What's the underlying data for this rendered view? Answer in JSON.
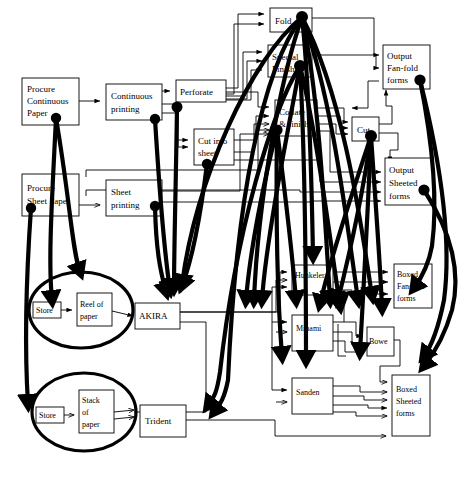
{
  "diagram": {
    "type": "process-flow-network",
    "width": 476,
    "height": 480,
    "background_color": "#ffffff",
    "line_color": "#000000",
    "nodes": [
      {
        "id": "procure_continuous",
        "label": "Procure\nContinuous\nPaper",
        "lines": [
          "Procure",
          "Continuous",
          "Paper"
        ],
        "shape": "rect",
        "x": 22,
        "y": 78,
        "w": 57,
        "h": 47
      },
      {
        "id": "procure_sheet",
        "label": "Procure\nSheet Paper",
        "lines": [
          "Procure",
          "Sheet Paper"
        ],
        "shape": "rect",
        "x": 22,
        "y": 174,
        "w": 57,
        "h": 42
      },
      {
        "id": "continuous_printing",
        "label": "Continuous\nprinting",
        "lines": [
          "Continuous",
          "printing"
        ],
        "shape": "rect",
        "x": 106,
        "y": 84,
        "w": 56,
        "h": 36
      },
      {
        "id": "sheet_printing",
        "label": "Sheet\nprinting",
        "lines": [
          "Sheet",
          "printing"
        ],
        "shape": "rect",
        "x": 106,
        "y": 180,
        "w": 56,
        "h": 36
      },
      {
        "id": "perforate",
        "label": "Perforate",
        "lines": [
          "Perforate"
        ],
        "shape": "rect",
        "x": 176,
        "y": 80,
        "w": 50,
        "h": 22
      },
      {
        "id": "cut_into_sheet",
        "label": "Cut into\nsheet",
        "lines": [
          "Cut into",
          "sheet"
        ],
        "shape": "rect",
        "x": 194,
        "y": 129,
        "w": 40,
        "h": 36
      },
      {
        "id": "fold",
        "label": "Fold",
        "lines": [
          "Fold"
        ],
        "shape": "rect",
        "x": 270,
        "y": 8,
        "w": 42,
        "h": 24
      },
      {
        "id": "special_finish",
        "label": "Special\nFinish",
        "lines": [
          "Special",
          "Finish"
        ],
        "shape": "rect",
        "x": 268,
        "y": 45,
        "w": 44,
        "h": 32
      },
      {
        "id": "collate_finish",
        "label": "Collate\n& finish",
        "lines": [
          "Collate",
          "& finish"
        ],
        "shape": "rect",
        "x": 275,
        "y": 100,
        "w": 42,
        "h": 36
      },
      {
        "id": "cut",
        "label": "Cut",
        "lines": [
          "Cut"
        ],
        "shape": "rect",
        "x": 352,
        "y": 117,
        "w": 27,
        "h": 24
      },
      {
        "id": "output_fanfold",
        "label": "Output\nFan-fold\nforms",
        "lines": [
          "Output",
          "Fan-fold",
          "forms"
        ],
        "shape": "rect",
        "x": 383,
        "y": 45,
        "w": 47,
        "h": 44
      },
      {
        "id": "output_sheeted",
        "label": "Output\nSheeted\nforms",
        "lines": [
          "Output",
          "Sheeted",
          "forms"
        ],
        "shape": "rect",
        "x": 385,
        "y": 158,
        "w": 48,
        "h": 47
      },
      {
        "id": "store_reel",
        "label": "Store",
        "lines": [
          "Store"
        ],
        "shape": "rect",
        "x": 33,
        "y": 302,
        "w": 28,
        "h": 16
      },
      {
        "id": "reel_of_paper",
        "label": "Reel of\npaper",
        "lines": [
          "Reel of",
          "paper"
        ],
        "shape": "rect",
        "x": 77,
        "y": 293,
        "w": 35,
        "h": 33
      },
      {
        "id": "ellipse_reel",
        "label": "",
        "lines": [],
        "shape": "ellipse",
        "cx": 81,
        "cy": 310,
        "rx": 52,
        "ry": 38
      },
      {
        "id": "akira",
        "label": "AKIRA",
        "lines": [
          "AKIRA"
        ],
        "shape": "rect",
        "x": 135,
        "y": 303,
        "w": 45,
        "h": 26
      },
      {
        "id": "store_stack",
        "label": "Store",
        "lines": [
          "Store"
        ],
        "shape": "rect",
        "x": 36,
        "y": 407,
        "w": 28,
        "h": 16
      },
      {
        "id": "stack_of_paper",
        "label": "Stack\nof\npaper",
        "lines": [
          "Stack",
          "of",
          "paper"
        ],
        "shape": "rect",
        "x": 79,
        "y": 390,
        "w": 35,
        "h": 43
      },
      {
        "id": "ellipse_stack",
        "label": "",
        "lines": [],
        "shape": "ellipse",
        "cx": 84,
        "cy": 412,
        "rx": 52,
        "ry": 39
      },
      {
        "id": "trident",
        "label": "Trident",
        "lines": [
          "Trident"
        ],
        "shape": "rect",
        "x": 140,
        "y": 405,
        "w": 46,
        "h": 32
      },
      {
        "id": "hunkeler",
        "label": "Hunkeler",
        "lines": [
          "Hunkeler"
        ],
        "shape": "rect",
        "x": 292,
        "y": 265,
        "w": 41,
        "h": 30
      },
      {
        "id": "minami",
        "label": "Minami",
        "lines": [
          "Minami"
        ],
        "shape": "rect",
        "x": 292,
        "y": 315,
        "w": 41,
        "h": 36
      },
      {
        "id": "sanden",
        "label": "Sanden",
        "lines": [
          "Sanden"
        ],
        "shape": "rect",
        "x": 292,
        "y": 378,
        "w": 41,
        "h": 36
      },
      {
        "id": "bowe",
        "label": "Bowe",
        "lines": [
          "Bowe"
        ],
        "shape": "rect",
        "x": 367,
        "y": 327,
        "w": 27,
        "h": 29
      },
      {
        "id": "boxed_fanfold",
        "label": "Boxed\nFan-fold\nforms",
        "lines": [
          "Boxed",
          "Fan-fold",
          "forms"
        ],
        "shape": "rect",
        "x": 394,
        "y": 264,
        "w": 38,
        "h": 44
      },
      {
        "id": "boxed_sheeted",
        "label": "Boxed\nSheeted\nforms",
        "lines": [
          "Boxed",
          "Sheeted",
          "forms"
        ],
        "shape": "rect",
        "x": 392,
        "y": 375,
        "w": 38,
        "h": 61
      }
    ],
    "thin_edges": [
      "procure_continuous -> continuous_printing",
      "procure_sheet -> sheet_printing",
      "continuous_printing -> perforate",
      "continuous_printing -> cut_into_sheet",
      "perforate -> fold",
      "perforate -> special_finish",
      "perforate -> collate_finish",
      "cut_into_sheet -> collate_finish",
      "sheet_printing -> collate_finish",
      "fold -> output_fanfold",
      "special_finish -> output_fanfold",
      "cut -> output_fanfold",
      "cut -> output_sheeted",
      "collate_finish -> cut",
      "collate_finish -> output_sheeted",
      "store_reel -> reel_of_paper",
      "reel_of_paper -> akira",
      "store_stack -> stack_of_paper",
      "stack_of_paper -> trident",
      "akira -> hunkeler",
      "akira -> minami",
      "akira -> sanden",
      "trident -> sanden",
      "trident -> boxed_sheeted",
      "hunkeler -> boxed_fanfold",
      "minami -> bowe",
      "minami -> boxed_fanfold",
      "sanden -> boxed_sheeted",
      "bowe -> boxed_sheeted"
    ],
    "bold_edges_note": "Thick curved mapping links connect process activities to the physical machines and storage ellipses",
    "legend": {
      "thin": "logical process flow (thin arrows)",
      "thick": "resource / machine allocation (thick curves with terminal dots)"
    }
  }
}
